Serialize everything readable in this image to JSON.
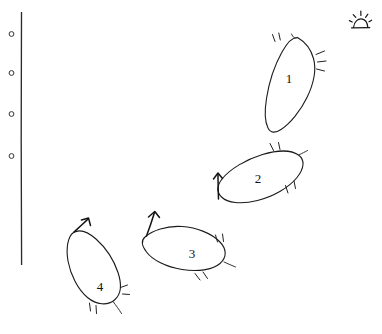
{
  "figure": {
    "kind": "hand-drawn-sketch",
    "background_color": "#ffffff",
    "ink_color": "#1a1a1a",
    "width": 382,
    "height": 334
  },
  "axis": {
    "name": "vertical-line",
    "orientation": "vertical",
    "x": 21,
    "y_top": 12,
    "y_bottom": 265,
    "markers": [
      {
        "label": "",
        "glyph": "circle",
        "x": 11,
        "y": 34
      },
      {
        "label": "",
        "glyph": "circle",
        "x": 11,
        "y": 73
      },
      {
        "label": "",
        "glyph": "circle",
        "x": 11,
        "y": 114
      },
      {
        "label": "",
        "glyph": "circle",
        "x": 11,
        "y": 156
      }
    ]
  },
  "sun_symbol": {
    "name": "sun-icon",
    "label": "",
    "x": 360,
    "y": 20,
    "ray_count": 5
  },
  "shapes": [
    {
      "id": "shape-1",
      "label": "1",
      "label_x": 289,
      "label_y": 80,
      "orientation": "tilted-vertical",
      "has_arrow": false,
      "hatch_count": 5
    },
    {
      "id": "shape-2",
      "label": "2",
      "label_x": 258,
      "label_y": 180,
      "orientation": "tilted-horizontal",
      "has_arrow": true,
      "arrow_direction": "up",
      "hatch_count": 4
    },
    {
      "id": "shape-3",
      "label": "3",
      "label_x": 192,
      "label_y": 255,
      "orientation": "tilted-horizontal",
      "has_arrow": true,
      "arrow_direction": "up",
      "hatch_count": 5
    },
    {
      "id": "shape-4",
      "label": "4",
      "label_x": 100,
      "label_y": 288,
      "orientation": "tilted-vertical",
      "has_arrow": true,
      "arrow_direction": "up",
      "hatch_count": 5
    }
  ]
}
